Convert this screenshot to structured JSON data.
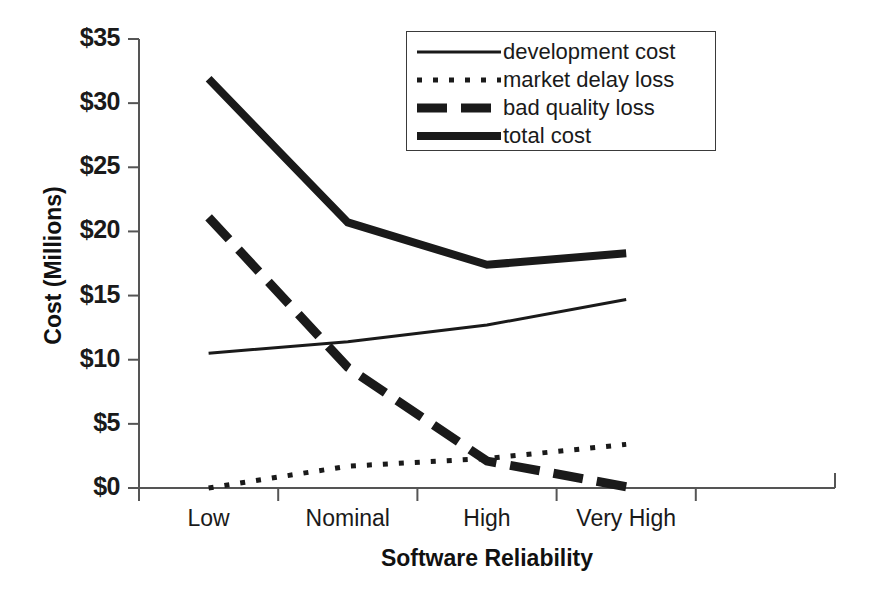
{
  "chart_data": {
    "type": "line",
    "title": "",
    "xlabel": "Software Reliability",
    "ylabel": "Cost (Millions)",
    "categories": [
      "Low",
      "Nominal",
      "High",
      "Very High"
    ],
    "ylim": [
      0,
      35
    ],
    "ytick_values": [
      0,
      5,
      10,
      15,
      20,
      25,
      30,
      35
    ],
    "ytick_labels": [
      "$0",
      "$5",
      "$10",
      "$15",
      "$20",
      "$25",
      "$30",
      "$35"
    ],
    "grid": false,
    "legend_position": "top-right",
    "series": [
      {
        "name": "development cost",
        "style": "solid-thin",
        "color": "#1a1a1a",
        "values": [
          10.5,
          11.4,
          12.7,
          14.7
        ]
      },
      {
        "name": "market delay loss",
        "style": "dotted",
        "color": "#1a1a1a",
        "values": [
          0.0,
          1.7,
          2.3,
          3.4
        ]
      },
      {
        "name": "bad quality loss",
        "style": "dashed-thick",
        "color": "#1a1a1a",
        "values": [
          21.1,
          9.4,
          2.1,
          0.1
        ]
      },
      {
        "name": "total cost",
        "style": "solid-thick",
        "color": "#1a1a1a",
        "values": [
          31.9,
          20.7,
          17.4,
          18.3
        ]
      }
    ]
  },
  "axes": {
    "y_title": "Cost (Millions)",
    "x_title": "Software Reliability"
  },
  "legend": {
    "entries": [
      {
        "label": "development cost",
        "swatch": "solid-thin-line-swatch"
      },
      {
        "label": "market delay loss",
        "swatch": "dotted-line-swatch"
      },
      {
        "label": "bad quality loss",
        "swatch": "dashed-thick-line-swatch"
      },
      {
        "label": "total cost",
        "swatch": "solid-thick-line-swatch"
      }
    ]
  },
  "ticks": {
    "y": [
      "$35",
      "$30",
      "$25",
      "$20",
      "$15",
      "$10",
      "$5",
      "$0"
    ],
    "x": [
      "Low",
      "Nominal",
      "High",
      "Very High"
    ]
  }
}
